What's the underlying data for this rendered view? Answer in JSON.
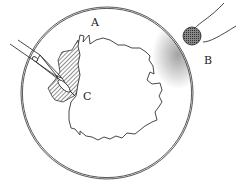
{
  "figure": {
    "type": "line-drawing",
    "colors": {
      "ink": "#333333",
      "background": "#ffffff"
    }
  },
  "labels": {
    "A": "A",
    "B": "B",
    "C": "C"
  },
  "parts": [
    {
      "id": "petri-dish",
      "label_ref": "A"
    },
    {
      "id": "round-probe",
      "label_ref": "B"
    },
    {
      "id": "shaded-region",
      "label_ref": "C"
    },
    {
      "id": "pipette"
    },
    {
      "id": "irregular-colony"
    },
    {
      "id": "stippled-edge"
    }
  ]
}
